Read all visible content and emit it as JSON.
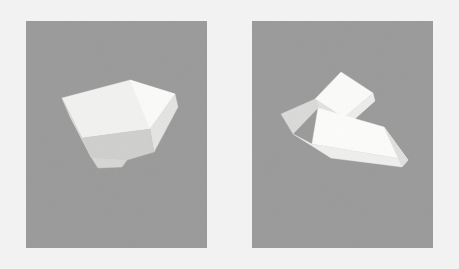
{
  "figure": {
    "width": 459,
    "height": 269,
    "background_color": "#f2f2f2",
    "panel_background_color": "#9a9a9a",
    "panel_count": 2
  },
  "panels": [
    {
      "id": "panel-left",
      "name": "left-panel",
      "position": {
        "x": 26,
        "y": 21,
        "width": 181,
        "height": 227
      },
      "background_color": "#9a9a9a",
      "object": {
        "name": "truncated-wedge-polyhedron",
        "description": "Pale convex polyhedron resembling a truncated wedge viewed from above-left",
        "face_count": 5,
        "faces": [
          {
            "name": "top-face",
            "fill": "#f2f2f0",
            "points": "36,77 104,59 149,73 124,108 56,117"
          },
          {
            "name": "upper-right-face",
            "fill": "#fbfbfa",
            "points": "104,59 149,73 124,108"
          },
          {
            "name": "right-flank-face",
            "fill": "#e4e4e2",
            "points": "149,73 152,86 128,131 124,108"
          },
          {
            "name": "front-face",
            "fill": "#cfcfcd",
            "points": "56,117 124,108 128,131 101,139 65,136"
          },
          {
            "name": "lower-left-face",
            "fill": "#dcdcda",
            "points": "36,77 56,117 65,136 44,96"
          },
          {
            "name": "bottom-bevel-face",
            "fill": "#d6d6d4",
            "points": "65,136 101,139 96,146 72,147"
          }
        ]
      }
    },
    {
      "id": "panel-right",
      "name": "right-panel",
      "position": {
        "x": 252,
        "y": 21,
        "width": 181,
        "height": 227
      },
      "background_color": "#9a9a9a",
      "object": {
        "name": "folded-wing-polyhedron",
        "description": "Pale polyhedron with an upper folded flap and a lower swept triangular wing, viewed at an angle",
        "face_count": 7,
        "faces": [
          {
            "name": "upper-flap-top-face",
            "fill": "#fbfbfa",
            "points": "89,51 121,72 92,97 63,78"
          },
          {
            "name": "upper-flap-right-face",
            "fill": "#ededeb",
            "points": "121,72 123,80 95,105 92,97"
          },
          {
            "name": "upper-flap-left-face",
            "fill": "#e2e2e0",
            "points": "63,78 92,97 95,105 66,87"
          },
          {
            "name": "left-tip-face",
            "fill": "#dadad8",
            "points": "29,93 63,78 66,87 41,113"
          },
          {
            "name": "lower-wing-top-face",
            "fill": "#fcfcfb",
            "points": "66,87 132,106 156,139 60,123"
          },
          {
            "name": "lower-wing-front-face",
            "fill": "#efefed",
            "points": "41,113 60,123 156,139 150,146 79,137"
          },
          {
            "name": "lower-wing-right-face",
            "fill": "#e0e0de",
            "points": "132,106 156,139 150,146"
          }
        ]
      }
    }
  ],
  "colors": {
    "page_background": "#f2f2f2",
    "panel_gray": "#9a9a9a",
    "highlight_white": "#fcfcfb",
    "mid_gray": "#dcdcda",
    "shadow_gray": "#cfcfcd"
  }
}
